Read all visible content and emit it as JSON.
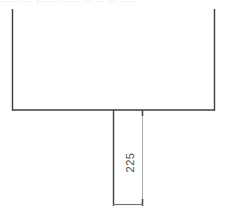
{
  "drawing": {
    "title_strip": {
      "text": "——  —  |——  ——  — — —                ——",
      "legible": false
    },
    "dimensions": [
      {
        "id": "dim-225",
        "value": "225",
        "unit": "",
        "orientation": "vertical",
        "rotation_deg": -90,
        "label": "225"
      }
    ],
    "geometry": {
      "shape_name": "t-profile-outline",
      "rectangle": {
        "left": 12,
        "right": 215,
        "bottom": 110,
        "top_cropped": true
      },
      "stem": {
        "x": 113,
        "top": 110,
        "bottom": 206
      },
      "extension_line": {
        "x": 143,
        "top": 110,
        "bottom": 206
      },
      "dimension_line": {
        "y": 204,
        "from_x": 113,
        "to_x": 143
      }
    },
    "colors": {
      "outline": "#3c3c3c",
      "extension": "#a8a8a8",
      "dimension_line": "#6e6e6e",
      "text": "#4a4a4a",
      "faint_text": "#e8e8ea",
      "background": "#ffffff"
    }
  }
}
